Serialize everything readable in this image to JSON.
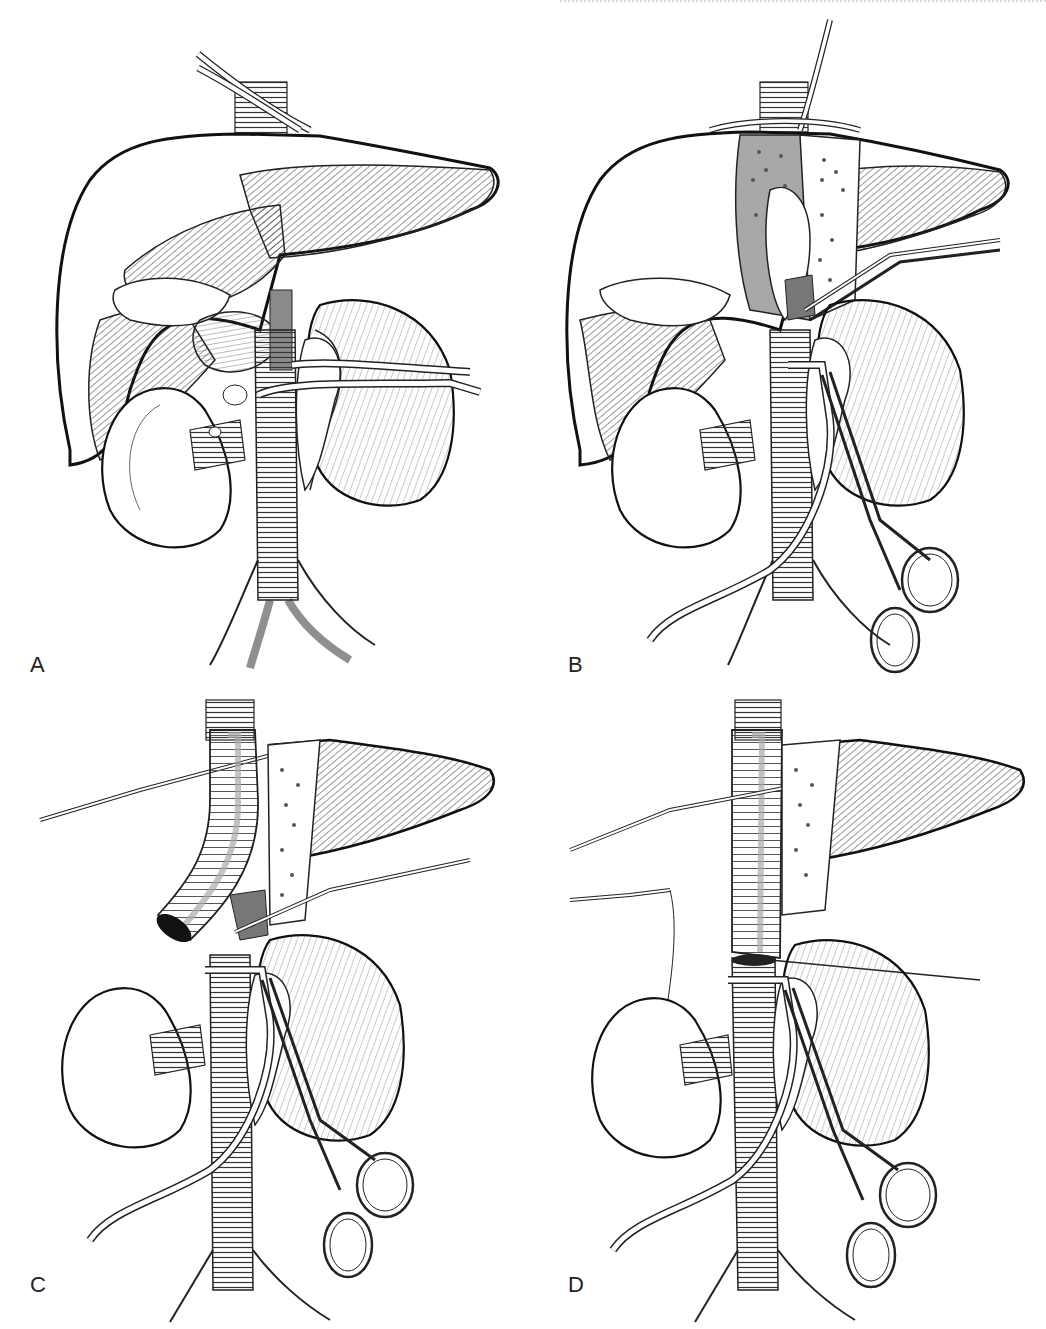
{
  "figure": {
    "panels": [
      {
        "id": "A",
        "label": "A",
        "content": "Liver with IVC exposed, vessel loops around suprahepatic IVC and renal veins, kidneys"
      },
      {
        "id": "B",
        "label": "B",
        "content": "Liver rotated with caudate exposed, clamps on IVC, hemostat clamp below"
      },
      {
        "id": "C",
        "label": "C",
        "content": "Ringed graft tube brought down, clamps on IVC and liver"
      },
      {
        "id": "D",
        "label": "D",
        "content": "Graft anastomosed to infrahepatic IVC with suture, clamps in place"
      }
    ],
    "colors": {
      "ink": "#1a1a1a",
      "hatch": "#3a3a3a",
      "shade": "#8a8a8a",
      "background": "#ffffff"
    }
  }
}
